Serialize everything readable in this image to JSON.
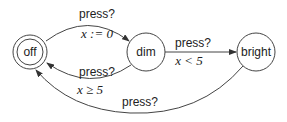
{
  "states": [
    {
      "id": "off",
      "label": "off",
      "initial": true
    },
    {
      "id": "dim",
      "label": "dim"
    },
    {
      "id": "bright",
      "label": "bright"
    }
  ],
  "transitions": [
    {
      "from": "off",
      "to": "dim",
      "action": "press?",
      "update": "x := 0"
    },
    {
      "from": "dim",
      "to": "off",
      "action": "press?",
      "guard": "x ≥ 5"
    },
    {
      "from": "dim",
      "to": "bright",
      "action": "press?",
      "guard": "x < 5"
    },
    {
      "from": "bright",
      "to": "off",
      "action": "press?"
    }
  ]
}
